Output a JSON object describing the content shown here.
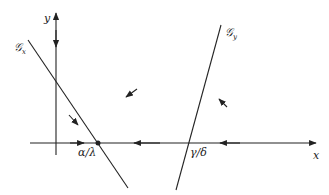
{
  "diagram": {
    "type": "phase-plane",
    "axes": {
      "x_label": "x",
      "y_label": "y"
    },
    "nullclines": [
      {
        "name": "G",
        "subscript": "x",
        "label": "𝒢"
      },
      {
        "name": "G",
        "subscript": "y",
        "label": "𝒢"
      }
    ],
    "equilibria": [
      {
        "label": "α/λ",
        "filled": true
      },
      {
        "label": "γ/δ",
        "filled": false
      }
    ],
    "colors": {
      "stroke": "#222222",
      "background": "#ffffff"
    }
  }
}
